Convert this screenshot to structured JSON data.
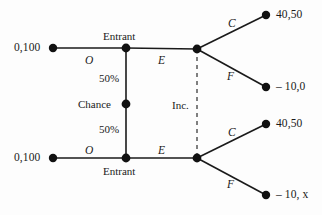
{
  "diagram": {
    "type": "game-tree-extensive-form",
    "colors": {
      "line": "#1a1a1a",
      "node": "#111111",
      "background": "#fdfdfd",
      "dashed": "#555555"
    },
    "players": {
      "chance": "Chance",
      "entrant_top": "Entrant",
      "entrant_bottom": "Entrant",
      "incumbent": "Inc."
    },
    "probabilities": {
      "top": "50%",
      "bottom": "50%"
    },
    "actions": {
      "out_top": "O",
      "enter_top": "E",
      "out_bottom": "O",
      "enter_bottom": "E",
      "accommodate_top": "C",
      "fight_top": "F",
      "accommodate_bottom": "C",
      "fight_bottom": "F"
    },
    "payoffs": {
      "out_top": "0,100",
      "out_bottom": "0,100",
      "accommodate_top": "40,50",
      "fight_top": "– 10,0",
      "accommodate_bottom": "40,50",
      "fight_bottom": "– 10, x"
    },
    "nodes": [
      {
        "id": "terminal-out-top",
        "x": 53,
        "y": 48,
        "kind": "terminal"
      },
      {
        "id": "entrant-top",
        "x": 126,
        "y": 48,
        "kind": "decision"
      },
      {
        "id": "chance",
        "x": 126,
        "y": 104,
        "kind": "chance"
      },
      {
        "id": "entrant-bottom",
        "x": 126,
        "y": 158,
        "kind": "decision"
      },
      {
        "id": "terminal-out-bottom",
        "x": 53,
        "y": 158,
        "kind": "terminal"
      },
      {
        "id": "incumbent-top",
        "x": 197,
        "y": 49,
        "kind": "decision"
      },
      {
        "id": "incumbent-bottom",
        "x": 197,
        "y": 158,
        "kind": "decision"
      },
      {
        "id": "terminal-c-top",
        "x": 266,
        "y": 15,
        "kind": "terminal"
      },
      {
        "id": "terminal-f-top",
        "x": 266,
        "y": 87,
        "kind": "terminal"
      },
      {
        "id": "terminal-c-bottom",
        "x": 266,
        "y": 124,
        "kind": "terminal"
      },
      {
        "id": "terminal-f-bottom",
        "x": 266,
        "y": 195,
        "kind": "terminal"
      }
    ]
  }
}
